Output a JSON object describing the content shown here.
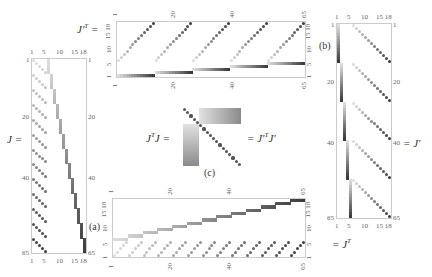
{
  "figure": {
    "panels": {
      "J": {
        "label": "J =",
        "tag": "(a)",
        "rows": 65,
        "cols": 18,
        "top_ticks": [
          "1",
          "5",
          "10",
          "15 18"
        ],
        "bottom_ticks": [
          "1",
          "5",
          "10",
          "15 18"
        ],
        "left_ticks": [
          "1",
          "20",
          "40",
          "65"
        ],
        "right_ticks": [
          "1",
          "20",
          "40",
          "65"
        ]
      },
      "JpT": {
        "label": "J′T =",
        "label_main": "J′",
        "label_sup": "T",
        "label_eq": " =",
        "rows": 18,
        "cols": 65,
        "top_ticks": [
          "1",
          "20",
          "40",
          "65"
        ],
        "bottom_ticks": [
          "1",
          "20",
          "40",
          "65"
        ],
        "left_ticks": [
          "1",
          "5",
          "10",
          "15 18"
        ],
        "right_ticks": [
          "1",
          "5",
          "10",
          "15 18"
        ]
      },
      "Jp": {
        "label": "= J′",
        "tag": "(b)",
        "rows": 65,
        "cols": 18,
        "top_ticks": [
          "1",
          "5",
          "10",
          "15 18"
        ],
        "bottom_ticks": [
          "1",
          "5",
          "10",
          "15 18"
        ],
        "left_ticks": [
          "1",
          "20",
          "40",
          "65"
        ],
        "right_ticks": [
          "1",
          "20",
          "40",
          "65"
        ]
      },
      "JT": {
        "label": "= J",
        "label_sup": "T",
        "rows": 18,
        "cols": 65,
        "top_ticks": [
          "1",
          "20",
          "40",
          "65"
        ],
        "bottom_ticks": [
          "1",
          "20",
          "40",
          "65"
        ],
        "left_ticks": [
          "1",
          "5",
          "10",
          "15 18"
        ],
        "right_ticks": [
          "1",
          "5",
          "10",
          "15 18"
        ]
      },
      "JTJ": {
        "label_left": "J",
        "label_left_sup": "T",
        "label_left_tail": "J =",
        "label_right": "= J′",
        "label_right_sup": "T",
        "label_right_tail": "J′",
        "tag": "(c)"
      }
    },
    "colors": {
      "frame": "#cccccc",
      "light": "#d8d8d8",
      "dark": "#444444"
    }
  }
}
